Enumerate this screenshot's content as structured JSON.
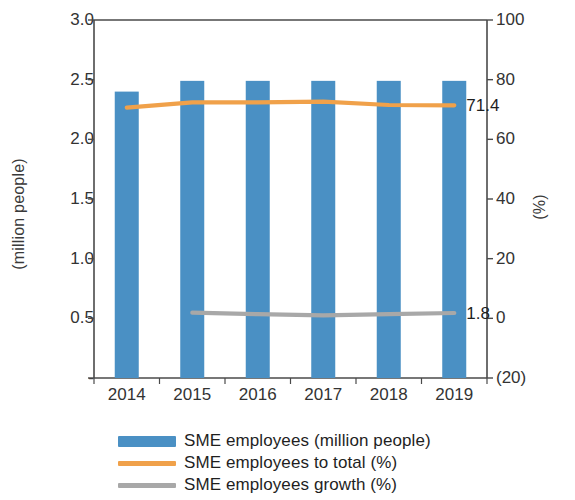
{
  "chart_data": {
    "type": "bar",
    "title": "",
    "subtitle": "",
    "xlabel": "",
    "ylabel": "(million people)",
    "y2label": "(%)",
    "categories": [
      "2014",
      "2015",
      "2016",
      "2017",
      "2018",
      "2019"
    ],
    "ylim": [
      0,
      3.0
    ],
    "y2lim": [
      -20,
      100
    ],
    "ytick_labels": [
      "3.0",
      "2.5",
      "2.0",
      "1.5",
      "1.0",
      "0.5",
      "-"
    ],
    "ytick_values": [
      3.0,
      2.5,
      2.0,
      1.5,
      1.0,
      0.5,
      0
    ],
    "y2tick_labels": [
      "100",
      "80",
      "60",
      "40",
      "20",
      "0",
      "(20)"
    ],
    "y2tick_values": [
      100,
      80,
      60,
      40,
      20,
      0,
      -20
    ],
    "grid": false,
    "legend_position": "bottom",
    "series": [
      {
        "name": "SME employees (million people)",
        "type": "bar",
        "axis": "left",
        "color": "#4a90c4",
        "values": [
          2.4,
          2.49,
          2.49,
          2.49,
          2.49,
          2.49
        ]
      },
      {
        "name": "SME employees to total (%)",
        "type": "line",
        "axis": "right",
        "color": "#f0a14a",
        "values": [
          70.6,
          72.4,
          72.4,
          72.6,
          71.5,
          71.4
        ]
      },
      {
        "name": "SME employees growth (%)",
        "type": "line",
        "axis": "right",
        "color": "#a8a8a8",
        "values": [
          null,
          1.9,
          1.4,
          1.0,
          1.4,
          1.8
        ]
      }
    ],
    "annotations": [
      {
        "text": "71.4",
        "series": "SME employees to total (%)",
        "category": "2019",
        "value": 71.4
      },
      {
        "text": "1.8",
        "series": "SME employees growth (%)",
        "category": "2019",
        "value": 1.8
      }
    ]
  },
  "legend": {
    "items": [
      {
        "label": "SME employees (million people)",
        "color": "#4a90c4",
        "marker": "bar"
      },
      {
        "label": "SME employees to total (%)",
        "color": "#f0a14a",
        "marker": "line"
      },
      {
        "label": "SME employees growth (%)",
        "color": "#a8a8a8",
        "marker": "line"
      }
    ]
  },
  "colors": {
    "bar": "#4a90c4",
    "line_total": "#f0a14a",
    "line_growth": "#a8a8a8",
    "axis": "#4a4a4a",
    "text": "#2b2b2b",
    "background": "#ffffff"
  }
}
